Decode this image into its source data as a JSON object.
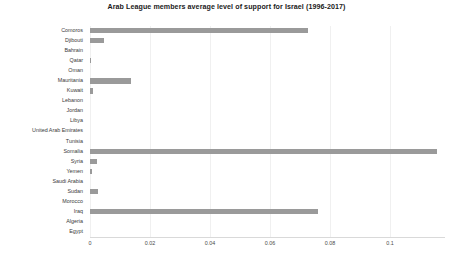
{
  "chart_data": {
    "type": "bar",
    "orientation": "horizontal",
    "title": "Arab League members average level of support for Israel (1996-2017)",
    "xlabel": "",
    "ylabel": "",
    "xlim": [
      0,
      0.1183
    ],
    "grid": true,
    "legend": null,
    "bar_color": "#9a9a9a",
    "xticks": [
      0,
      0.02,
      0.04,
      0.06,
      0.08,
      0.1
    ],
    "xtick_labels": [
      "0",
      "0.02",
      "0.04",
      "0.06",
      "0.08",
      "0.1"
    ],
    "categories": [
      "Comoros",
      "Djibouti",
      "Bahrain",
      "Qatar",
      "Oman",
      "Mauritania",
      "Kuwait",
      "Lebanon",
      "Jordan",
      "Libya",
      "United Arab Emirates",
      "Tunisia",
      "Somalia",
      "Syria",
      "Yemen",
      "Saudi Arabia",
      "Sudan",
      "Morocco",
      "Iraq",
      "Algeria",
      "Egypt"
    ],
    "values": [
      0.0727,
      0.0047,
      0,
      0.0004,
      0,
      0.0137,
      0.0011,
      0,
      0,
      0,
      0,
      0,
      0.1157,
      0.0024,
      0.0007,
      0,
      0.0027,
      0,
      0.076,
      0,
      0
    ]
  }
}
